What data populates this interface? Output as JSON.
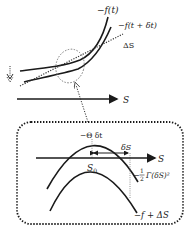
{
  "top_panel": {
    "curve1_label": "−f(t)",
    "curve2_label": "−f(t + δt)",
    "tangent_label": "ΔS",
    "axis_label": "S"
  },
  "bottom_panel": {
    "peak_label": "−Θ δt",
    "delta_label": "δS",
    "axis_label": "S",
    "origin_label": "S",
    "origin_sub": "0",
    "quad_label_prefix": "−",
    "quad_num": "1",
    "quad_den": "2",
    "quad_label_suffix": "Γ(δS)²",
    "lower_curve_label": "−f + ΔS"
  },
  "colors": {
    "stroke": "#1a1a1a",
    "dotted": "#333333",
    "ellipse": "#777777"
  }
}
